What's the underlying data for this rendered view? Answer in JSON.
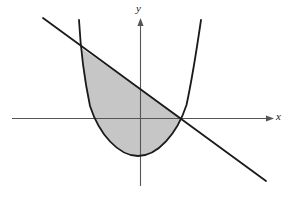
{
  "figure": {
    "background_color": "#ffffff",
    "width": 289,
    "height": 198,
    "axes": {
      "x_label": "x",
      "y_label": "y",
      "axis_color": "#555555",
      "axis_width": 1.1,
      "origin_px": {
        "x": 140.5,
        "y": 118.5
      },
      "x_axis": {
        "start_px": 12,
        "end_px": 274,
        "y_px": 118.5,
        "arrow": "right"
      },
      "y_axis": {
        "start_px": 186,
        "end_px": 18,
        "x_px": 140.5,
        "arrow": "up"
      }
    },
    "curves": [
      {
        "name": "parabola",
        "type": "quadratic",
        "color": "#1a1a1a",
        "stroke_width": 1.8,
        "opens": "up",
        "vertex_px": {
          "x": 138.0,
          "y": 156.0
        },
        "x_intercepts_px": [
          99.5,
          182.0
        ],
        "top_left_px": {
          "x": 79.0,
          "y": 20.0
        },
        "top_right_px": {
          "x": 201.0,
          "y": 20.0
        }
      },
      {
        "name": "line",
        "type": "linear",
        "color": "#1a1a1a",
        "stroke_width": 1.8,
        "slope_sign": "negative",
        "start_px": {
          "x": 43.0,
          "y": 18.0
        },
        "end_px": {
          "x": 266.0,
          "y": 181.0
        },
        "x_intercept_px": 182.0
      }
    ],
    "shaded_region": {
      "name": "region-between-line-and-parabola",
      "fill_color": "#c6c6c6",
      "upper_boundary": "line",
      "lower_boundary": "parabola",
      "intersections_px": [
        {
          "x": 81.0,
          "y": 48.0
        },
        {
          "x": 182.0,
          "y": 118.0
        }
      ]
    }
  }
}
